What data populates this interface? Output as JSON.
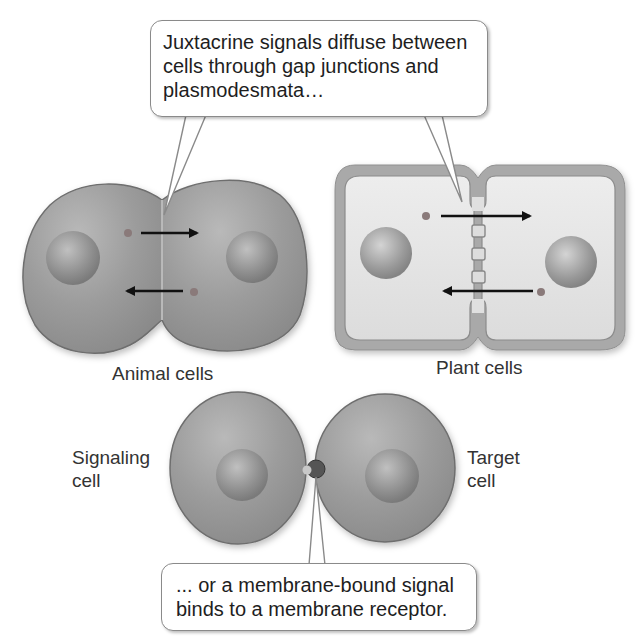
{
  "figure": {
    "top_callout": {
      "lines": [
        "Juxtacrine signals diffuse between",
        "cells through gap junctions and",
        "plasmodesmata…"
      ]
    },
    "bottom_callout": {
      "lines": [
        "... or a membrane-bound signal",
        "binds to a membrane receptor."
      ]
    },
    "panels": {
      "animal": {
        "label": "Animal cells"
      },
      "plant": {
        "label": "Plant cells"
      },
      "membrane": {
        "signaling_label": [
          "Signaling",
          "cell"
        ],
        "target_label": [
          "Target",
          "cell"
        ]
      }
    },
    "colors": {
      "cell_fill": "#9a9a9a",
      "cell_edge": "#6e6e6e",
      "nucleus": "#8c8c8c",
      "plant_wall": "#a8a8a8",
      "plant_interior": "#e6e6e6",
      "arrow": "#111111"
    }
  }
}
